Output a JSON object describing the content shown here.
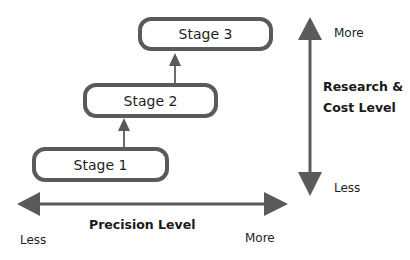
{
  "diagram": {
    "type": "staged-progression",
    "stages": [
      {
        "label": "Stage 1"
      },
      {
        "label": "Stage 2"
      },
      {
        "label": "Stage 3"
      }
    ],
    "vertical_axis": {
      "title_line1": "Research &",
      "title_line2": "Cost Level",
      "top_label": "More",
      "bottom_label": "Less"
    },
    "horizontal_axis": {
      "title": "Precision Level",
      "left_label": "Less",
      "right_label": "More"
    },
    "colors": {
      "stroke": "#5a5a5a",
      "text": "#1e1e1e",
      "background": "#ffffff"
    }
  }
}
